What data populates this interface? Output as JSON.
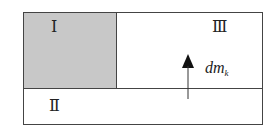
{
  "diagram": {
    "regions": [
      {
        "id": "I",
        "label": "Ⅰ",
        "shaded": true
      },
      {
        "id": "II",
        "label": "Ⅱ",
        "shaded": false
      },
      {
        "id": "III",
        "label": "Ⅲ",
        "shaded": false
      }
    ],
    "flow": {
      "label_main": "dm",
      "label_sub": "k",
      "direction": "up",
      "from": "II",
      "to": "III"
    }
  }
}
